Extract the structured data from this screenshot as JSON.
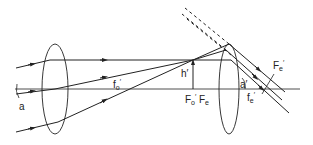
{
  "diagram": {
    "labels": {
      "alpha": "a",
      "f_o_prime": "f",
      "f_o_prime_sub": "o",
      "f_o_prime_mark": "′",
      "h_prime": "h′",
      "F_o_prime": "F",
      "F_o_prime_sub": "o",
      "F_o_prime_mark": "′",
      "F_e": "F",
      "F_e_sub": "e",
      "alpha_prime": "a′",
      "f_e_prime": "f",
      "f_e_prime_sub": "e",
      "f_e_prime_mark": "′",
      "F_e_prime": "F",
      "F_e_prime_sub": "e",
      "F_e_prime_mark": "′"
    },
    "colors": {
      "stroke": "#222222",
      "background": "#ffffff"
    }
  }
}
